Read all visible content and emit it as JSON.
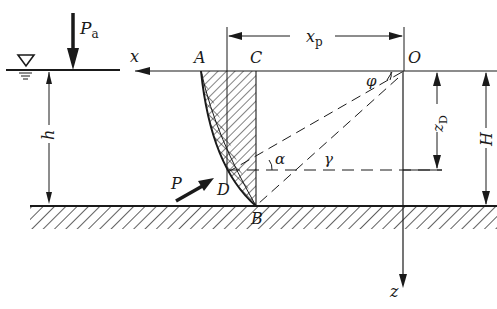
{
  "diagram": {
    "type": "hydrostatic pressure on curved surface",
    "labels": {
      "atm_pressure": "P",
      "atm_pressure_sub": "a",
      "x_axis": "x",
      "z_axis": "z",
      "point_A": "A",
      "point_B": "B",
      "point_C": "C",
      "point_D": "D",
      "origin": "O",
      "xp": "x",
      "xp_sub": "p",
      "zd": "z",
      "zd_sub": "D",
      "depth_h": "h",
      "depth_H": "H",
      "force_P": "P",
      "angle_alpha": "α",
      "angle_gamma": "γ",
      "angle_phi": "φ"
    },
    "colors": {
      "ink": "#1a1a1a",
      "background": "#ffffff"
    }
  }
}
